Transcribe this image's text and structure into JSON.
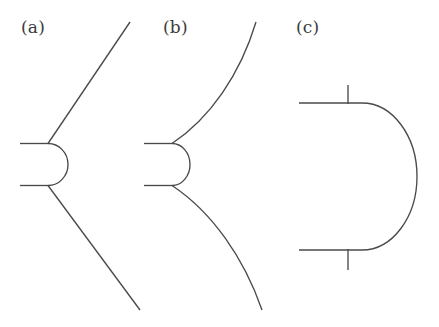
{
  "figure": {
    "background_color": "#ffffff",
    "stroke_color": "#4a4a4a",
    "stroke_width": 1.35,
    "width": 439,
    "height": 327
  },
  "panels": [
    {
      "id": "a",
      "label": "(a)",
      "label_position": {
        "x": 21,
        "y": 19
      },
      "shape_name": "cusp-with-straight-rays",
      "elements": {
        "upper_stub_label": "upper horizontal segment",
        "lower_stub_label": "lower horizontal segment",
        "arc_label": "right-bulging connecting arc",
        "upper_ray_label": "upper straight ray",
        "lower_ray_label": "lower straight ray"
      }
    },
    {
      "id": "b",
      "label": "(b)",
      "label_position": {
        "x": 163,
        "y": 19
      },
      "shape_name": "cusp-with-curved-branches",
      "elements": {
        "upper_stub_label": "upper horizontal segment",
        "lower_stub_label": "lower horizontal segment",
        "arc_label": "right-bulging connecting arc",
        "upper_branch_label": "upper curved branch",
        "lower_branch_label": "lower curved branch"
      }
    },
    {
      "id": "c",
      "label": "(c)",
      "label_position": {
        "x": 296,
        "y": 19
      },
      "shape_name": "semicircular-cap-with-ticks",
      "elements": {
        "upper_line_label": "upper horizontal line",
        "lower_line_label": "lower horizontal line",
        "arc_label": "large right semicircular arc",
        "upper_tick_label": "upper vertical tick mark",
        "lower_tick_label": "lower vertical tick mark"
      }
    }
  ],
  "chart_data": {
    "type": "line",
    "title": "",
    "xlabel": "",
    "ylabel": "",
    "grid": false,
    "legend": null,
    "xlim": [
      0,
      439
    ],
    "ylim": [
      327,
      0
    ],
    "note": "Vector line art; coordinates given in image pixel space with y increasing downward.",
    "series": [
      {
        "name": "a-upper-stub",
        "panel": "a",
        "kind": "polyline",
        "points": [
          [
            20,
            143.5
          ],
          [
            48,
            143.5
          ]
        ]
      },
      {
        "name": "a-lower-stub",
        "panel": "a",
        "kind": "polyline",
        "points": [
          [
            20,
            185.5
          ],
          [
            48,
            185.5
          ]
        ]
      },
      {
        "name": "a-connecting-arc",
        "panel": "a",
        "kind": "arc",
        "start": [
          48,
          143.5
        ],
        "end": [
          48,
          185.5
        ],
        "bulge_apex": [
          68,
          164.5
        ],
        "bulge_direction": "right"
      },
      {
        "name": "a-upper-ray",
        "panel": "a",
        "kind": "polyline",
        "points": [
          [
            48,
            143.5
          ],
          [
            130,
            22
          ]
        ]
      },
      {
        "name": "a-lower-ray",
        "panel": "a",
        "kind": "polyline",
        "points": [
          [
            48,
            185.5
          ],
          [
            140,
            310
          ]
        ]
      },
      {
        "name": "b-upper-stub",
        "panel": "b",
        "kind": "polyline",
        "points": [
          [
            144,
            143.5
          ],
          [
            172,
            143.5
          ]
        ]
      },
      {
        "name": "b-lower-stub",
        "panel": "b",
        "kind": "polyline",
        "points": [
          [
            144,
            185.5
          ],
          [
            172,
            185.5
          ]
        ]
      },
      {
        "name": "b-connecting-arc",
        "panel": "b",
        "kind": "arc",
        "start": [
          172,
          143.5
        ],
        "end": [
          172,
          185.5
        ],
        "bulge_apex": [
          190,
          164.5
        ],
        "bulge_direction": "right"
      },
      {
        "name": "b-upper-branch",
        "panel": "b",
        "kind": "cubic",
        "start": [
          172,
          143.5
        ],
        "control1": [
          210,
          118
        ],
        "control2": [
          240,
          75
        ],
        "end": [
          256,
          22
        ]
      },
      {
        "name": "b-lower-branch",
        "panel": "b",
        "kind": "cubic",
        "start": [
          172,
          185.5
        ],
        "control1": [
          212,
          212
        ],
        "control2": [
          244,
          258
        ],
        "end": [
          262,
          310
        ]
      },
      {
        "name": "c-upper-line",
        "panel": "c",
        "kind": "polyline",
        "points": [
          [
            299,
            103
          ],
          [
            362,
            103
          ]
        ]
      },
      {
        "name": "c-lower-line",
        "panel": "c",
        "kind": "polyline",
        "points": [
          [
            299,
            250
          ],
          [
            362,
            250
          ]
        ]
      },
      {
        "name": "c-semicircular-arc",
        "panel": "c",
        "kind": "arc",
        "start": [
          362,
          103
        ],
        "end": [
          362,
          250
        ],
        "bulge_apex": [
          417,
          176.5
        ],
        "bulge_direction": "right"
      },
      {
        "name": "c-upper-tick",
        "panel": "c",
        "kind": "polyline",
        "points": [
          [
            348,
            85
          ],
          [
            348,
            104
          ]
        ]
      },
      {
        "name": "c-lower-tick",
        "panel": "c",
        "kind": "polyline",
        "points": [
          [
            348,
            249
          ],
          [
            348,
            270
          ]
        ]
      }
    ]
  }
}
